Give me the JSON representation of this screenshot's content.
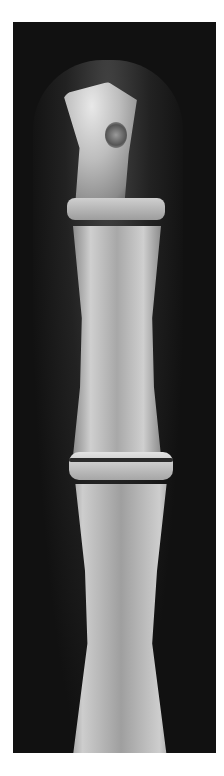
{
  "image": {
    "subject": "X-ray radiograph of a finger showing distal, middle and proximal phalanges",
    "background_color": "#ffffff",
    "frame_color": "#111111",
    "bone_color": "#c8c8c8"
  }
}
